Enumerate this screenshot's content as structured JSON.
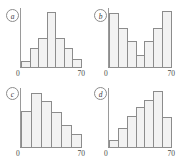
{
  "figure": {
    "background": "#ffffff",
    "bar_fill": "#f2f2f2",
    "bar_edge": "#8c8c8c",
    "axis_color": "#8e8e8e",
    "panel_count": 4
  },
  "chart_data": [
    {
      "type": "bar",
      "panel": "a",
      "label": "a",
      "title": "",
      "xlabel": "",
      "ylabel": "",
      "shape": "symmetric bell-shaped",
      "xlim": [
        0,
        70
      ],
      "xticks": [
        0,
        70
      ],
      "xticklabels": [
        "0",
        "70"
      ],
      "grid": false,
      "bin_width": 10,
      "categories": [
        "0-10",
        "10-20",
        "20-30",
        "30-40",
        "40-50",
        "50-60",
        "60-70"
      ],
      "values": [
        8,
        26,
        40,
        74,
        40,
        26,
        11
      ],
      "ylim": [
        0,
        80
      ]
    },
    {
      "type": "bar",
      "panel": "b",
      "label": "b",
      "title": "",
      "xlabel": "",
      "ylabel": "",
      "shape": "bimodal U-shaped",
      "xlim": [
        0,
        70
      ],
      "xticks": [
        0,
        70
      ],
      "xticklabels": [
        "0",
        "70"
      ],
      "grid": false,
      "bin_width": 10,
      "categories": [
        "0-10",
        "10-20",
        "20-30",
        "30-40",
        "40-50",
        "50-60",
        "60-70"
      ],
      "values": [
        78,
        56,
        38,
        18,
        38,
        56,
        80
      ],
      "ylim": [
        0,
        85
      ]
    },
    {
      "type": "bar",
      "panel": "c",
      "label": "c",
      "title": "",
      "xlabel": "",
      "ylabel": "",
      "shape": "right-skewed",
      "xlim": [
        0,
        70
      ],
      "xticks": [
        0,
        70
      ],
      "xticklabels": [
        "0",
        "70"
      ],
      "grid": false,
      "bin_width": 11.67,
      "categories": [
        "0-12",
        "12-23",
        "23-35",
        "35-47",
        "47-58",
        "58-70"
      ],
      "values": [
        52,
        78,
        66,
        50,
        32,
        19
      ],
      "ylim": [
        0,
        85
      ]
    },
    {
      "type": "bar",
      "panel": "d",
      "label": "d",
      "title": "",
      "xlabel": "",
      "ylabel": "",
      "shape": "left-skewed",
      "xlim": [
        0,
        70
      ],
      "xticks": [
        0,
        70
      ],
      "xticklabels": [
        "0",
        "70"
      ],
      "grid": false,
      "bin_width": 10,
      "categories": [
        "0-10",
        "10-20",
        "20-30",
        "30-40",
        "40-50",
        "50-60",
        "60-70"
      ],
      "values": [
        10,
        28,
        45,
        57,
        68,
        80,
        43
      ],
      "ylim": [
        0,
        85
      ]
    }
  ]
}
